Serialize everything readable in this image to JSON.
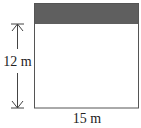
{
  "diagram": {
    "height_label": "12 m",
    "width_label": "15 m",
    "colors": {
      "outline": "#555555",
      "shaded_band": "#5f5f5f",
      "text": "#222222"
    }
  }
}
